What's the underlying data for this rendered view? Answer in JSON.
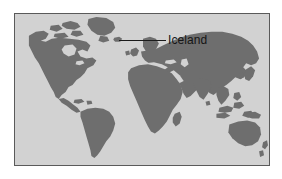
{
  "figure": {
    "type": "world-map-locator",
    "background_color": "#ffffff"
  },
  "map": {
    "projection_note": "world map, cropped above Antarctica",
    "ocean_color": "#d2d2d2",
    "land_color": "#6e6e6e",
    "border_color": "#5a5a5a",
    "landmasses": [
      "North America",
      "Greenland",
      "South America",
      "Europe",
      "Africa",
      "Madagascar",
      "Asia",
      "Japan",
      "Southeast Asia",
      "Australia",
      "New Zealand",
      "Iceland"
    ]
  },
  "annotations": [
    {
      "label": "Iceland",
      "leader_line": true
    }
  ]
}
